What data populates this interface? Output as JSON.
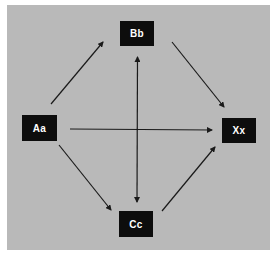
{
  "diagram": {
    "background_color": "#b9b9b9",
    "node_color": "#0d0d0d",
    "text_color": "#ffffff",
    "edge_color": "#1a1a1a",
    "nodes": [
      {
        "id": "aa",
        "label": "Aa"
      },
      {
        "id": "bb",
        "label": "Bb"
      },
      {
        "id": "cc",
        "label": "Cc"
      },
      {
        "id": "xx",
        "label": "Xx"
      }
    ],
    "edges": [
      {
        "from": "Aa",
        "to": "Bb",
        "direction": "forward"
      },
      {
        "from": "Bb",
        "to": "Xx",
        "direction": "forward"
      },
      {
        "from": "Aa",
        "to": "Cc",
        "direction": "forward"
      },
      {
        "from": "Cc",
        "to": "Xx",
        "direction": "forward"
      },
      {
        "from": "Aa",
        "to": "Xx",
        "direction": "forward"
      },
      {
        "from": "Bb",
        "to": "Cc",
        "direction": "bidirectional"
      }
    ]
  }
}
